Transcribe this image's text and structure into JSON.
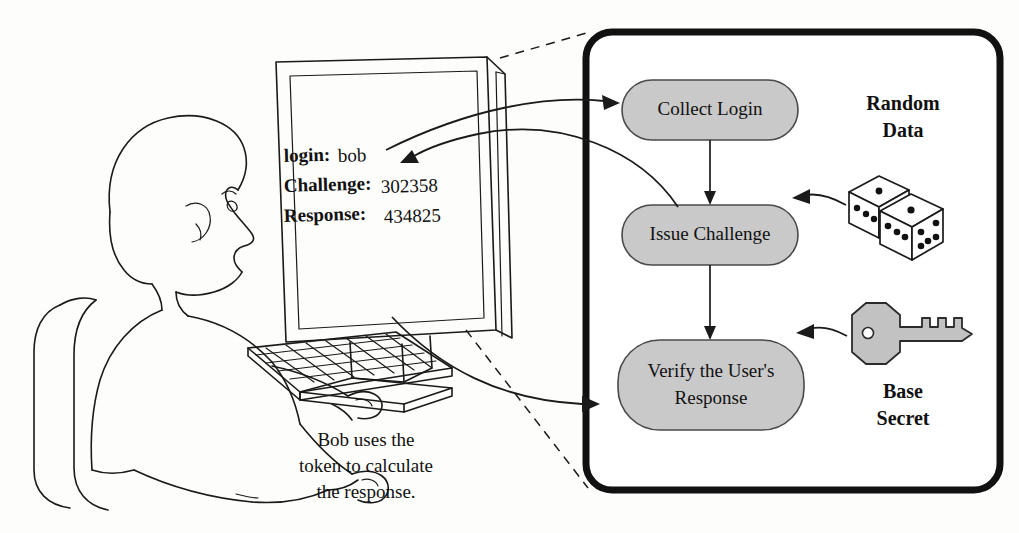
{
  "figure": {
    "background_color": "#fdfdfb",
    "ink_color": "#1a1a1a",
    "node_fill_color": "#c9c9c9",
    "key_fill_color": "#c2c2c2"
  },
  "screen": {
    "line1_label": "login:",
    "line1_value": "bob",
    "line2_label": "Challenge:",
    "line2_value": "302358",
    "line3_label": "Response:",
    "line3_value": "434825"
  },
  "caption": {
    "line1": "Bob uses the",
    "line2": "token to calculate",
    "line3": "the response."
  },
  "flow": {
    "nodes": [
      {
        "id": "collect-login",
        "label": "Collect Login"
      },
      {
        "id": "issue-challenge",
        "label": "Issue Challenge"
      },
      {
        "id": "verify-response",
        "label_line1": "Verify the User's",
        "label_line2": "Response"
      }
    ]
  },
  "inputs": {
    "random_data": {
      "line1": "Random",
      "line2": "Data",
      "icon": "dice-icon"
    },
    "base_secret": {
      "line1": "Base",
      "line2": "Secret",
      "icon": "key-icon"
    }
  },
  "actors": {
    "person": "person-at-computer-icon",
    "monitor": "crt-monitor-icon",
    "keyboard": "keyboard-icon",
    "chair": "chair-icon"
  }
}
